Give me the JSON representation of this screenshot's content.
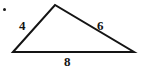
{
  "figure": {
    "kind": "triangle-diagram",
    "background_color": "#ffffff",
    "stroke_color": "#141414",
    "stroke_width": 2,
    "vertices": {
      "bottom_left": {
        "x": 13,
        "y": 52
      },
      "apex": {
        "x": 55,
        "y": 5
      },
      "bottom_right": {
        "x": 134,
        "y": 52
      }
    },
    "labels": {
      "left_side": "4",
      "right_side": "6",
      "base": "8"
    },
    "label_color": "#141414",
    "marks": {
      "stray_dot_color": "#1a1a1a"
    }
  }
}
